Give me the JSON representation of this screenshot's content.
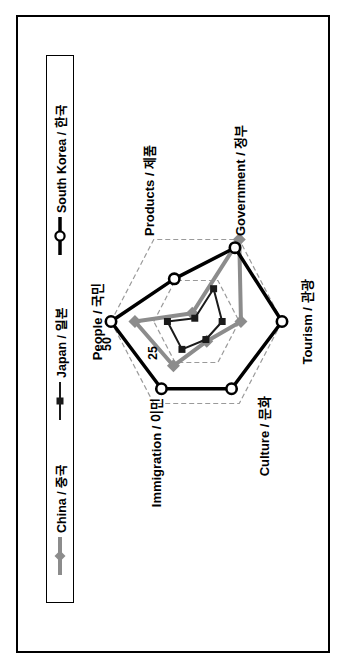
{
  "chart_data": {
    "type": "radar",
    "title": "",
    "categories": [
      "People / 국민",
      "Products / 제품",
      "Government / 정부",
      "Tourism / 관광",
      "Culture / 문화",
      "Immigration / 이민"
    ],
    "series": [
      {
        "name": "China / 중국",
        "key": "china",
        "color": "#8c8c8c",
        "marker": "diamond",
        "line_width": 4,
        "values": [
          36,
          5,
          50,
          26,
          12,
          27
        ]
      },
      {
        "name": "Japan / 일본",
        "key": "japan",
        "color": "#1a1a1a",
        "marker": "square",
        "line_width": 2,
        "values": [
          17,
          2,
          20,
          15,
          11,
          17
        ]
      },
      {
        "name": "South Korea / 한국",
        "key": "south_korea",
        "color": "#000000",
        "marker": "circle-open",
        "line_width": 3.5,
        "values": [
          50,
          26,
          45,
          50,
          41,
          41
        ]
      }
    ],
    "rmax": 50,
    "ticks": [
      25,
      50
    ],
    "tick_labels": [
      "50",
      "25"
    ],
    "gridline_style": "dashed",
    "gridline_color": "#9a9a9a",
    "legend_position": "top",
    "figure_rotation_deg": -90
  }
}
